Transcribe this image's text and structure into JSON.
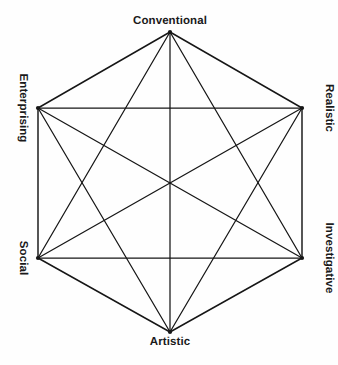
{
  "diagram": {
    "shape": "hexagon",
    "graph_type": "complete-graph-k6",
    "background_color": "#fefefe",
    "line_color": "#161616",
    "text_color": "#1a1a1a",
    "canvas": {
      "width": 338,
      "height": 365
    },
    "center": {
      "x": 170,
      "y": 183
    },
    "vertices": [
      {
        "id": "conventional",
        "label": "Conventional",
        "code": "C",
        "x": 170,
        "y": 32,
        "position": "top",
        "label_rotation_deg": 0
      },
      {
        "id": "realistic",
        "label": "Realistic",
        "code": "R",
        "x": 302,
        "y": 108,
        "position": "upper-right",
        "label_rotation_deg": 90
      },
      {
        "id": "investigative",
        "label": "Investigative",
        "code": "I",
        "x": 302,
        "y": 258,
        "position": "lower-right",
        "label_rotation_deg": 90
      },
      {
        "id": "artistic",
        "label": "Artistic",
        "code": "A",
        "x": 170,
        "y": 332,
        "position": "bottom",
        "label_rotation_deg": 0
      },
      {
        "id": "social",
        "label": "Social",
        "code": "S",
        "x": 38,
        "y": 258,
        "position": "lower-left",
        "label_rotation_deg": 90
      },
      {
        "id": "enterprising",
        "label": "Enterprising",
        "code": "E",
        "x": 38,
        "y": 108,
        "position": "upper-left",
        "label_rotation_deg": 90
      }
    ],
    "edges": [
      {
        "from": "conventional",
        "to": "realistic",
        "kind": "perimeter"
      },
      {
        "from": "realistic",
        "to": "investigative",
        "kind": "perimeter"
      },
      {
        "from": "investigative",
        "to": "artistic",
        "kind": "perimeter"
      },
      {
        "from": "artistic",
        "to": "social",
        "kind": "perimeter"
      },
      {
        "from": "social",
        "to": "enterprising",
        "kind": "perimeter"
      },
      {
        "from": "enterprising",
        "to": "conventional",
        "kind": "perimeter"
      },
      {
        "from": "conventional",
        "to": "investigative",
        "kind": "short-diagonal"
      },
      {
        "from": "conventional",
        "to": "social",
        "kind": "short-diagonal"
      },
      {
        "from": "realistic",
        "to": "artistic",
        "kind": "short-diagonal"
      },
      {
        "from": "realistic",
        "to": "enterprising",
        "kind": "short-diagonal"
      },
      {
        "from": "investigative",
        "to": "social",
        "kind": "short-diagonal"
      },
      {
        "from": "artistic",
        "to": "enterprising",
        "kind": "short-diagonal"
      },
      {
        "from": "conventional",
        "to": "artistic",
        "kind": "long-diagonal"
      },
      {
        "from": "realistic",
        "to": "social",
        "kind": "long-diagonal"
      },
      {
        "from": "investigative",
        "to": "enterprising",
        "kind": "long-diagonal"
      }
    ]
  }
}
